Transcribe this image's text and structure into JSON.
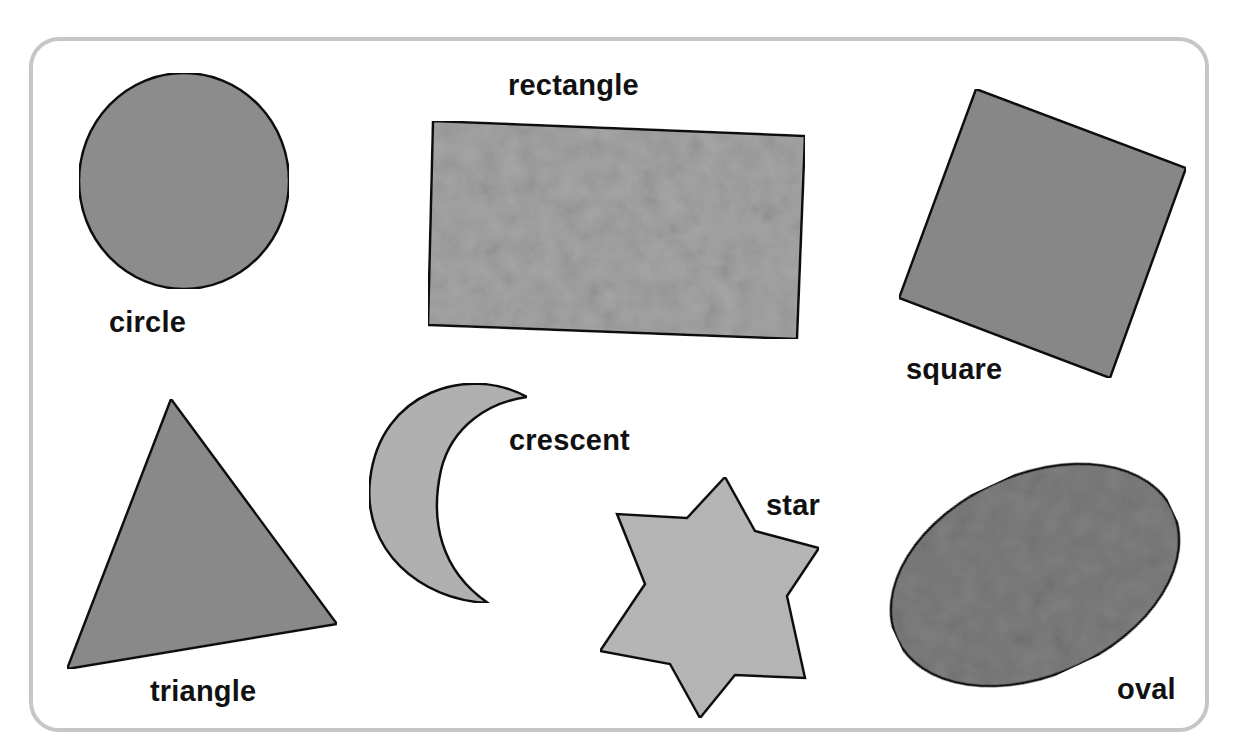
{
  "figure": {
    "frame_color": "#c6c6c6",
    "outline_color": "#111111"
  },
  "shapes": [
    {
      "id": "circle",
      "label": "circle",
      "fill": "#8f8f8f"
    },
    {
      "id": "rectangle",
      "label": "rectangle",
      "fill": "#a4a4a4"
    },
    {
      "id": "square",
      "label": "square",
      "fill": "#8a8a8a"
    },
    {
      "id": "triangle",
      "label": "triangle",
      "fill": "#8c8c8c"
    },
    {
      "id": "crescent",
      "label": "crescent",
      "fill": "#b3b3b3"
    },
    {
      "id": "star",
      "label": "star",
      "fill": "#b8b8b8"
    },
    {
      "id": "oval",
      "label": "oval",
      "fill": "#7f7f7f"
    }
  ]
}
